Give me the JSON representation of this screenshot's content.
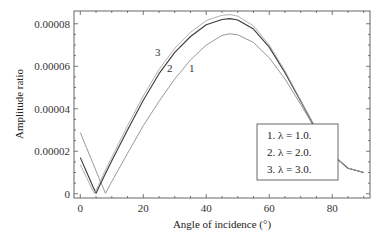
{
  "chart_data": {
    "type": "line",
    "title": "",
    "xlabel": "Angle of incidence (°)",
    "ylabel": "Amplitude ratio",
    "xlim": [
      -2,
      92
    ],
    "ylim": [
      -2e-06,
      8.6e-05
    ],
    "xticks": [
      0,
      20,
      40,
      60,
      80
    ],
    "xtick_labels": [
      "0",
      "20",
      "40",
      "60",
      "80"
    ],
    "yticks": [
      0,
      2e-05,
      4e-05,
      6e-05,
      8e-05
    ],
    "ytick_labels": [
      "0",
      "0.00002",
      "0.00004",
      "0.00006",
      "0.00008"
    ],
    "grid": false,
    "legend": {
      "placement": "bottom-right",
      "entries": [
        "1. λ = 1.0.",
        "2. λ = 2.0.",
        "3. λ = 3.0."
      ]
    },
    "curve_annotations": [
      "1",
      "2",
      "3"
    ],
    "series": [
      {
        "name": "1",
        "lambda": 1.0,
        "color": "#8c8c8c",
        "x": [
          0,
          2,
          4,
          6,
          8,
          10,
          15,
          20,
          25,
          30,
          35,
          40,
          45,
          47.5,
          50,
          55,
          60,
          65,
          70,
          75,
          80,
          85,
          90
        ],
        "y": [
          2.88e-05,
          2.16e-05,
          1.44e-05,
          7.2e-06,
          2e-07,
          5.8e-06,
          1.9e-05,
          3.2e-05,
          4.35e-05,
          5.4e-05,
          6.3e-05,
          7e-05,
          7.45e-05,
          7.53e-05,
          7.48e-05,
          7.12e-05,
          6.4e-05,
          5.4e-05,
          4.2e-05,
          2.95e-05,
          1.85e-05,
          1.2e-05,
          1e-05
        ]
      },
      {
        "name": "2",
        "lambda": 2.0,
        "color": "#3a3a3a",
        "x": [
          0,
          2,
          4,
          5,
          6,
          8,
          10,
          15,
          20,
          25,
          30,
          35,
          40,
          45,
          47.5,
          50,
          55,
          60,
          65,
          70,
          75,
          80,
          85,
          90
        ],
        "y": [
          1.7e-05,
          1.02e-05,
          3.4e-06,
          2e-07,
          3.4e-06,
          9.5e-06,
          1.55e-05,
          3e-05,
          4.4e-05,
          5.65e-05,
          6.65e-05,
          7.4e-05,
          7.95e-05,
          8.2e-05,
          8.24e-05,
          8.18e-05,
          7.75e-05,
          6.9e-05,
          5.7e-05,
          4.35e-05,
          3e-05,
          1.85e-05,
          1.2e-05,
          1e-05
        ]
      },
      {
        "name": "3",
        "lambda": 3.0,
        "color": "#a8a8a8",
        "x": [
          0,
          2,
          4,
          4.5,
          6,
          8,
          10,
          15,
          20,
          25,
          30,
          35,
          40,
          45,
          47.5,
          50,
          55,
          60,
          65,
          70,
          75,
          80,
          85,
          90
        ],
        "y": [
          1.37e-05,
          7.6e-06,
          1.4e-06,
          2e-07,
          4.8e-06,
          1.12e-05,
          1.72e-05,
          3.2e-05,
          4.6e-05,
          5.85e-05,
          6.85e-05,
          7.6e-05,
          8.15e-05,
          8.4e-05,
          8.43e-05,
          8.36e-05,
          7.9e-05,
          7e-05,
          5.78e-05,
          4.4e-05,
          3.02e-05,
          1.86e-05,
          1.21e-05,
          1e-05
        ]
      }
    ]
  }
}
